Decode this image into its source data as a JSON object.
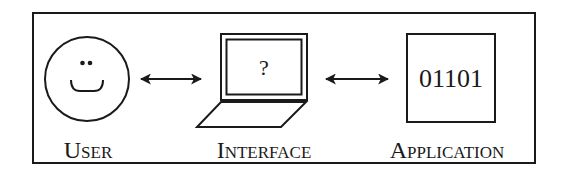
{
  "diagram": {
    "nodes": [
      {
        "id": "user",
        "label": "User",
        "icon": "smiley-face-icon"
      },
      {
        "id": "interface",
        "label": "Interface",
        "icon": "laptop-icon",
        "screen_text": "?"
      },
      {
        "id": "application",
        "label": "Application",
        "icon": "binary-box-icon",
        "box_text": "01101"
      }
    ],
    "edges": [
      {
        "from": "user",
        "to": "interface",
        "style": "bidirectional-arrow"
      },
      {
        "from": "interface",
        "to": "application",
        "style": "bidirectional-arrow"
      }
    ],
    "colors": {
      "stroke": "#1a1a1a",
      "background": "#ffffff"
    }
  }
}
